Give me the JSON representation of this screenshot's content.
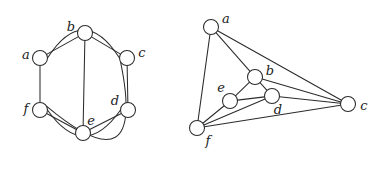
{
  "figure": {
    "background_color": "#ffffff",
    "stroke_color": "#2b2b2b",
    "node_fill_color": "#ffffff",
    "label_color": "#1c1c1c",
    "node_radius": 7.5,
    "width": 379,
    "height": 171
  },
  "chart_data": {
    "type": "diagram",
    "subtype": "graph-drawing",
    "title": "",
    "panels": [
      {
        "name": "left-graph",
        "caption": "",
        "nodes": [
          {
            "id": "a",
            "label": "a",
            "x": 40,
            "y": 58,
            "label_x": 26,
            "label_y": 55
          },
          {
            "id": "b",
            "label": "b",
            "x": 85,
            "y": 33,
            "label_x": 71,
            "label_y": 27
          },
          {
            "id": "c",
            "label": "c",
            "x": 127,
            "y": 58,
            "label_x": 142,
            "label_y": 53
          },
          {
            "id": "d",
            "label": "d",
            "x": 128,
            "y": 110,
            "label_x": 115,
            "label_y": 101
          },
          {
            "id": "e",
            "label": "e",
            "x": 83,
            "y": 133,
            "label_x": 91,
            "label_y": 121
          },
          {
            "id": "f",
            "label": "f",
            "x": 40,
            "y": 110,
            "label_x": 26,
            "label_y": 109
          }
        ],
        "edges": [
          {
            "from": "a",
            "to": "b",
            "shape": "line",
            "bend": 0
          },
          {
            "from": "b",
            "to": "c",
            "shape": "line",
            "bend": 0
          },
          {
            "from": "a",
            "to": "f",
            "shape": "line",
            "bend": 0
          },
          {
            "from": "c",
            "to": "d",
            "shape": "line",
            "bend": 0
          },
          {
            "from": "b",
            "to": "e",
            "shape": "line",
            "bend": 0
          },
          {
            "from": "f",
            "to": "e",
            "shape": "line",
            "bend": 0
          },
          {
            "from": "e",
            "to": "d",
            "shape": "line",
            "bend": 0
          },
          {
            "from": "a",
            "to": "c",
            "shape": "arc",
            "bend": -28
          },
          {
            "from": "f",
            "to": "d",
            "shape": "arc",
            "bend": 26
          },
          {
            "from": "f",
            "to": "c",
            "shape": "arc",
            "bend": 62
          }
        ]
      },
      {
        "name": "right-graph",
        "caption": "",
        "nodes": [
          {
            "id": "a",
            "label": "a",
            "x": 211,
            "y": 27,
            "label_x": 226,
            "label_y": 19
          },
          {
            "id": "b",
            "label": "b",
            "x": 255,
            "y": 77,
            "label_x": 270,
            "label_y": 71
          },
          {
            "id": "c",
            "label": "c",
            "x": 348,
            "y": 104,
            "label_x": 364,
            "label_y": 106
          },
          {
            "id": "d",
            "label": "d",
            "x": 272,
            "y": 96,
            "label_x": 278,
            "label_y": 110
          },
          {
            "id": "e",
            "label": "e",
            "x": 230,
            "y": 101,
            "label_x": 221,
            "label_y": 88
          },
          {
            "id": "f",
            "label": "f",
            "x": 197,
            "y": 128,
            "label_x": 208,
            "label_y": 141
          }
        ],
        "edges": [
          {
            "from": "a",
            "to": "b",
            "shape": "line",
            "bend": 0
          },
          {
            "from": "a",
            "to": "f",
            "shape": "line",
            "bend": 0
          },
          {
            "from": "a",
            "to": "c",
            "shape": "line",
            "bend": 0
          },
          {
            "from": "b",
            "to": "e",
            "shape": "line",
            "bend": 0
          },
          {
            "from": "b",
            "to": "d",
            "shape": "line",
            "bend": 0
          },
          {
            "from": "b",
            "to": "c",
            "shape": "line",
            "bend": 0
          },
          {
            "from": "e",
            "to": "f",
            "shape": "line",
            "bend": 0
          },
          {
            "from": "e",
            "to": "d",
            "shape": "line",
            "bend": 0
          },
          {
            "from": "d",
            "to": "f",
            "shape": "line",
            "bend": 0
          },
          {
            "from": "d",
            "to": "c",
            "shape": "line",
            "bend": 0
          },
          {
            "from": "f",
            "to": "c",
            "shape": "line",
            "bend": 0
          }
        ]
      }
    ],
    "vertex_labels": [
      "a",
      "b",
      "c",
      "d",
      "e",
      "f"
    ],
    "edge_count": 10,
    "vertex_count": 6
  }
}
